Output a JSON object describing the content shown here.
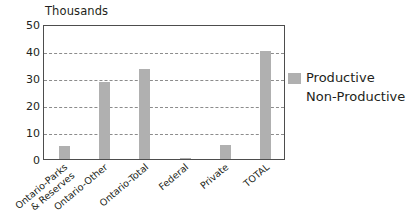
{
  "chart_data": {
    "type": "bar",
    "title": "",
    "unit_title": "Thousands",
    "xlabel": "",
    "ylabel": "",
    "ylim": [
      0,
      50
    ],
    "yticks": [
      0,
      10,
      20,
      30,
      40,
      50
    ],
    "ytick_labels": [
      "0",
      "10",
      "20",
      "30",
      "40",
      "50"
    ],
    "grid": true,
    "grid_axis": "y",
    "legend_position": "right",
    "categories": [
      "Ontario-Parks & Reserves",
      "Ontario-Other",
      "Ontario-Total",
      "Federal",
      "Private",
      "TOTAL"
    ],
    "category_lines": [
      [
        "Ontario-Parks",
        "& Reserves"
      ],
      [
        "Ontario-Other"
      ],
      [
        "Ontario-Total"
      ],
      [
        "Federal"
      ],
      [
        "Private"
      ],
      [
        "TOTAL"
      ]
    ],
    "series": [
      {
        "name": "Productive",
        "color": "#b0b0b0",
        "values": [
          4.7,
          28.7,
          33.3,
          0.3,
          5.2,
          40.0
        ]
      },
      {
        "name": "Non-Productive",
        "color": "#b0b0b0",
        "values": [
          null,
          null,
          null,
          null,
          null,
          null
        ]
      }
    ],
    "legend_entries": [
      {
        "label": "Productive",
        "color": "#b0b0b0",
        "swatch": true
      },
      {
        "label": "Non-Productive",
        "color": "#b0b0b0",
        "swatch": false
      }
    ]
  },
  "colors": {
    "bar": "#b0b0b0",
    "axis": "#4d4d4d",
    "grid": "#8c8c8c",
    "text": "#231f20",
    "background": "#ffffff"
  },
  "caption": ""
}
